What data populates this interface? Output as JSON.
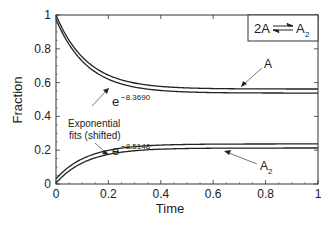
{
  "chart_data": {
    "type": "line",
    "title": "",
    "xlabel": "Time",
    "ylabel": "Fraction",
    "xlim": [
      0,
      1
    ],
    "ylim": [
      0,
      1
    ],
    "xticks": [
      "0",
      "0.2",
      "0.4",
      "0.6",
      "0.8",
      "1"
    ],
    "yticks": [
      "0",
      "0.2",
      "0.4",
      "0.6",
      "0.8",
      "1"
    ],
    "grid": false,
    "legend": null,
    "reaction_label": {
      "left": "2A",
      "right": "A",
      "right_sub": "2"
    },
    "series": [
      {
        "name": "A",
        "kind": "data",
        "y0": 1.0,
        "yinf": 0.562,
        "rate": 8.369
      },
      {
        "name": "A fit (shifted)",
        "kind": "fit",
        "y0": 0.975,
        "yinf": 0.538,
        "rate": 8.369
      },
      {
        "name": "A2 fit (shifted)",
        "kind": "fit",
        "y0": 0.03,
        "yinf": 0.237,
        "rate": 8.5148
      },
      {
        "name": "A2",
        "kind": "data",
        "y0": 0.005,
        "yinf": 0.213,
        "rate": 8.5148
      }
    ],
    "annotations": [
      {
        "text": "A",
        "sub": ""
      },
      {
        "text": "A",
        "sub": "2"
      },
      {
        "text": "e",
        "sup": "−8.3690"
      },
      {
        "text": "e",
        "sup": "−8.5148"
      },
      {
        "text": "Exponential",
        "line2": "fits (shifted)"
      }
    ]
  }
}
